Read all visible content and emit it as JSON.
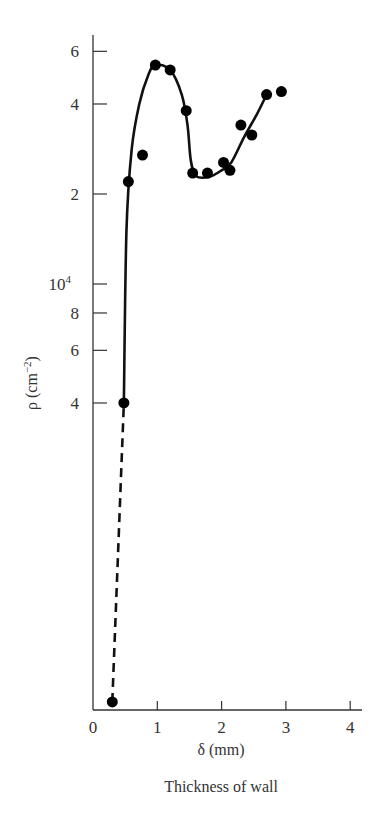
{
  "chart_data": {
    "type": "scatter",
    "title": "",
    "caption": "Thickness of wall",
    "xlabel": "δ (mm)",
    "ylabel": "ρ (cm⁻²)",
    "yscale": "log",
    "xlim": [
      0,
      4
    ],
    "ylim": [
      400,
      65000
    ],
    "grid": false,
    "legend": null,
    "x_ticks": [
      {
        "value": 0,
        "label": "0"
      },
      {
        "value": 1,
        "label": "1"
      },
      {
        "value": 2,
        "label": "2"
      },
      {
        "value": 3,
        "label": "3"
      },
      {
        "value": 4,
        "label": "4"
      }
    ],
    "y_ticks": [
      {
        "value": 4000,
        "label": "4"
      },
      {
        "value": 6000,
        "label": "6"
      },
      {
        "value": 8000,
        "label": "8"
      },
      {
        "value": 10000,
        "label": "10",
        "superscript": "4"
      },
      {
        "value": 20000,
        "label": "2"
      },
      {
        "value": 40000,
        "label": "4"
      },
      {
        "value": 60000,
        "label": "6"
      }
    ],
    "series": [
      {
        "name": "measured dislocation density",
        "marker": "filled-circle",
        "points": [
          {
            "x": 0.3,
            "y": 400
          },
          {
            "x": 0.48,
            "y": 4000
          },
          {
            "x": 0.55,
            "y": 22000
          },
          {
            "x": 0.77,
            "y": 27000
          },
          {
            "x": 0.97,
            "y": 54000
          },
          {
            "x": 1.2,
            "y": 52000
          },
          {
            "x": 1.45,
            "y": 38000
          },
          {
            "x": 1.55,
            "y": 23500
          },
          {
            "x": 1.78,
            "y": 23500
          },
          {
            "x": 2.03,
            "y": 25500
          },
          {
            "x": 2.13,
            "y": 24000
          },
          {
            "x": 2.3,
            "y": 34000
          },
          {
            "x": 2.47,
            "y": 31500
          },
          {
            "x": 2.7,
            "y": 43000
          },
          {
            "x": 2.93,
            "y": 44000
          }
        ]
      },
      {
        "name": "fitted curve",
        "style": "solid",
        "points": [
          {
            "x": 0.48,
            "y": 4000
          },
          {
            "x": 0.52,
            "y": 15000
          },
          {
            "x": 0.6,
            "y": 28000
          },
          {
            "x": 0.72,
            "y": 40000
          },
          {
            "x": 0.86,
            "y": 50000
          },
          {
            "x": 0.97,
            "y": 54000
          },
          {
            "x": 1.2,
            "y": 52000
          },
          {
            "x": 1.38,
            "y": 43000
          },
          {
            "x": 1.47,
            "y": 34000
          },
          {
            "x": 1.52,
            "y": 26000
          },
          {
            "x": 1.6,
            "y": 23000
          },
          {
            "x": 1.8,
            "y": 22800
          },
          {
            "x": 2.0,
            "y": 24000
          },
          {
            "x": 2.15,
            "y": 25500
          },
          {
            "x": 2.35,
            "y": 31000
          },
          {
            "x": 2.55,
            "y": 37000
          },
          {
            "x": 2.7,
            "y": 43000
          }
        ]
      },
      {
        "name": "extrapolation",
        "style": "dashed",
        "points": [
          {
            "x": 0.3,
            "y": 400
          },
          {
            "x": 0.48,
            "y": 4000
          }
        ]
      }
    ]
  },
  "axes": {
    "x_title": "δ (mm)",
    "y_title_main": "ρ (cm",
    "y_title_exp": "−2",
    "y_title_close": ")",
    "caption": "Thickness of wall"
  }
}
